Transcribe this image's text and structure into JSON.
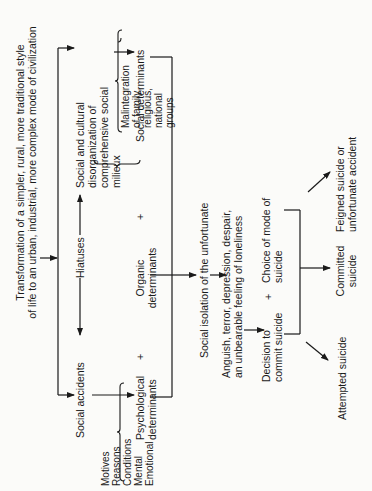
{
  "diagram": {
    "orientation": "rotated-90-ccw",
    "title": {
      "line1": "Transformation of a simpler, rural, more traditional style",
      "line2": "of life to an urban, industrial, more complex mode of civilization"
    },
    "level1": {
      "social_accidents": "Social accidents",
      "hiatuses": "Hiatuses",
      "social_cultural": {
        "line1": "Social and cultural",
        "line2": "disorganization of",
        "line3": "comprehensive social",
        "line4": "milieux"
      }
    },
    "determinants": {
      "psychological": {
        "line1": "Psychological",
        "line2": "determinants"
      },
      "organic": {
        "line1": "Organic",
        "line2": "determinants"
      },
      "social": "Social determinants",
      "plus": "+"
    },
    "psychological_factors": [
      "Motives",
      "Reasons",
      "Conditions",
      "Mental",
      "Emotional"
    ],
    "social_factors": [
      "Malintegration",
      "of family,",
      "religious,",
      "national",
      "groups"
    ],
    "isolation": "Social isolation of the unfortunate",
    "feelings": {
      "line1": "Anguish, terror, depression, despair,",
      "line2": "an unbearable feeling of loneliness"
    },
    "decision": {
      "line1": "Decision to",
      "line2": "commit suicide"
    },
    "choice": {
      "line1": "Choice of mode of",
      "line2": "suicide"
    },
    "outcomes": {
      "attempted": "Attempted suicide",
      "committed": {
        "line1": "Committed",
        "line2": "suicide"
      },
      "feigned": {
        "line1": "Feigned suicide or",
        "line2": "unfortunate accident"
      }
    }
  }
}
